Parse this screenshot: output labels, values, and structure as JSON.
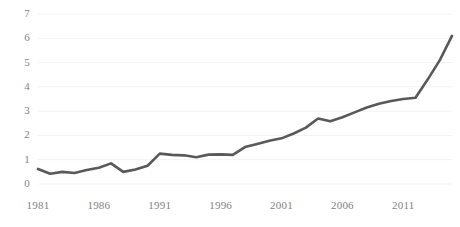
{
  "chart_data": {
    "type": "line",
    "title": "",
    "subtitle": "",
    "xlabel": "",
    "ylabel": "",
    "grid": "horizontal",
    "legend": "none",
    "xlim": [
      1981,
      2015
    ],
    "ylim": [
      0,
      7
    ],
    "ytick_values": [
      0,
      1,
      2,
      3,
      4,
      5,
      6,
      7
    ],
    "ytick_labels": [
      "0",
      "1",
      "2",
      "3",
      "4",
      "5",
      "6",
      "7"
    ],
    "xtick_values": [
      1981,
      1986,
      1991,
      1996,
      2001,
      2006,
      2011
    ],
    "xtick_labels": [
      "1981",
      "1986",
      "1991",
      "1996",
      "2001",
      "2006",
      "2011"
    ],
    "x": [
      1981,
      1982,
      1983,
      1984,
      1985,
      1986,
      1987,
      1988,
      1989,
      1990,
      1991,
      1992,
      1993,
      1994,
      1995,
      1996,
      1997,
      1998,
      1999,
      2000,
      2001,
      2002,
      2003,
      2004,
      2005,
      2006,
      2007,
      2008,
      2009,
      2010,
      2011,
      2012,
      2013,
      2014,
      2015
    ],
    "series": [
      {
        "name": "series-1",
        "color": "#595959",
        "values": [
          0.62,
          0.42,
          0.5,
          0.45,
          0.58,
          0.67,
          0.85,
          0.5,
          0.6,
          0.75,
          1.25,
          1.2,
          1.18,
          1.1,
          1.21,
          1.22,
          1.2,
          1.52,
          1.65,
          1.78,
          1.88,
          2.08,
          2.32,
          2.7,
          2.58,
          2.75,
          2.95,
          3.15,
          3.3,
          3.42,
          3.5,
          3.55,
          4.3,
          5.1,
          6.1
        ]
      }
    ],
    "colors": {
      "line": "#595959",
      "gridline": "#f2f2f2",
      "tick_text": "#7f7f7f",
      "background": "#ffffff"
    },
    "geometry": {
      "plot_left": 38,
      "plot_right": 452,
      "plot_top": 14,
      "plot_bottom": 184,
      "line_width": 2.6
    }
  }
}
